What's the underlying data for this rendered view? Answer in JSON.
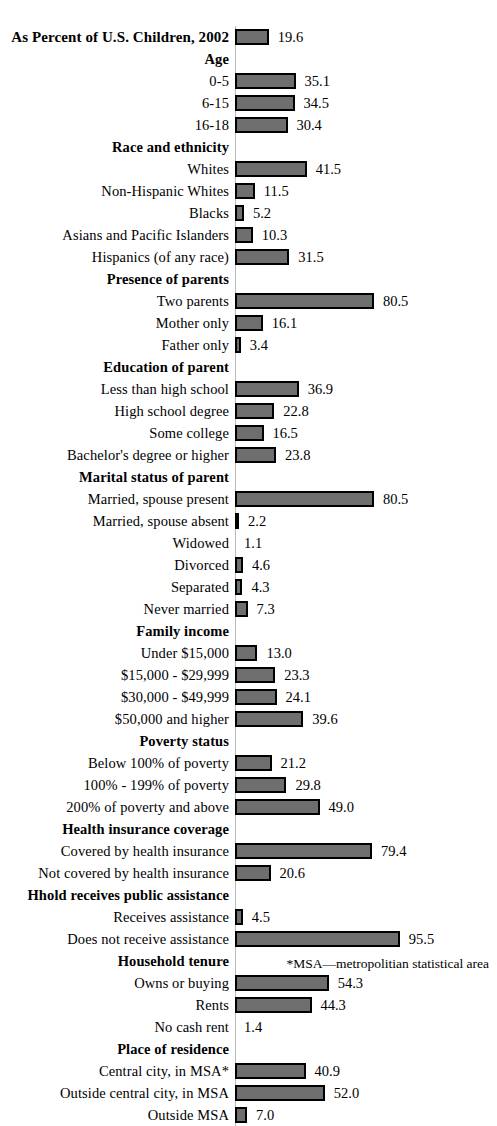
{
  "chart_data": {
    "type": "bar",
    "title": "As Percent of U.S. Children, 2002",
    "xlabel": "",
    "ylabel": "",
    "xlim": [
      0,
      95.5
    ],
    "grid": false,
    "legend": "none",
    "orientation": "horizontal",
    "value_format": "one-decimal percent",
    "footnote": "*MSA—metropolitian statistical area",
    "rows": [
      {
        "kind": "title",
        "label": "As Percent of U.S. Children, 2002",
        "value": 19.6,
        "value_text": "19.6"
      },
      {
        "kind": "header",
        "label": "Age"
      },
      {
        "kind": "data",
        "label": "0-5",
        "value": 35.1,
        "value_text": "35.1"
      },
      {
        "kind": "data",
        "label": "6-15",
        "value": 34.5,
        "value_text": "34.5"
      },
      {
        "kind": "data",
        "label": "16-18",
        "value": 30.4,
        "value_text": "30.4"
      },
      {
        "kind": "header",
        "label": "Race and ethnicity"
      },
      {
        "kind": "data",
        "label": "Whites",
        "value": 41.5,
        "value_text": "41.5"
      },
      {
        "kind": "data",
        "label": "Non-Hispanic Whites",
        "value": 11.5,
        "value_text": "11.5"
      },
      {
        "kind": "data",
        "label": "Blacks",
        "value": 5.2,
        "value_text": "5.2"
      },
      {
        "kind": "data",
        "label": "Asians and Pacific Islanders",
        "value": 10.3,
        "value_text": "10.3"
      },
      {
        "kind": "data",
        "label": "Hispanics (of any race)",
        "value": 31.5,
        "value_text": "31.5"
      },
      {
        "kind": "header",
        "label": "Presence of parents"
      },
      {
        "kind": "data",
        "label": "Two parents",
        "value": 80.5,
        "value_text": "80.5"
      },
      {
        "kind": "data",
        "label": "Mother only",
        "value": 16.1,
        "value_text": "16.1"
      },
      {
        "kind": "data",
        "label": "Father only",
        "value": 3.4,
        "value_text": "3.4"
      },
      {
        "kind": "header",
        "label": "Education of parent"
      },
      {
        "kind": "data",
        "label": "Less than high school",
        "value": 36.9,
        "value_text": "36.9"
      },
      {
        "kind": "data",
        "label": "High school degree",
        "value": 22.8,
        "value_text": "22.8"
      },
      {
        "kind": "data",
        "label": "Some college",
        "value": 16.5,
        "value_text": "16.5"
      },
      {
        "kind": "data",
        "label": "Bachelor's degree or higher",
        "value": 23.8,
        "value_text": "23.8"
      },
      {
        "kind": "header",
        "label": "Marital status of parent"
      },
      {
        "kind": "data",
        "label": "Married, spouse present",
        "value": 80.5,
        "value_text": "80.5"
      },
      {
        "kind": "data",
        "label": "Married, spouse absent",
        "value": 2.2,
        "value_text": "2.2"
      },
      {
        "kind": "data",
        "label": "Widowed",
        "value": 1.1,
        "value_text": "1.1",
        "no_bar": true
      },
      {
        "kind": "data",
        "label": "Divorced",
        "value": 4.6,
        "value_text": "4.6"
      },
      {
        "kind": "data",
        "label": "Separated",
        "value": 4.3,
        "value_text": "4.3"
      },
      {
        "kind": "data",
        "label": "Never married",
        "value": 7.3,
        "value_text": "7.3"
      },
      {
        "kind": "header",
        "label": "Family income"
      },
      {
        "kind": "data",
        "label": "Under $15,000",
        "value": 13.0,
        "value_text": "13.0"
      },
      {
        "kind": "data",
        "label": "$15,000 - $29,999",
        "value": 23.3,
        "value_text": "23.3"
      },
      {
        "kind": "data",
        "label": "$30,000 - $49,999",
        "value": 24.1,
        "value_text": "24.1"
      },
      {
        "kind": "data",
        "label": "$50,000 and higher",
        "value": 39.6,
        "value_text": "39.6"
      },
      {
        "kind": "header",
        "label": "Poverty status"
      },
      {
        "kind": "data",
        "label": "Below 100% of poverty",
        "value": 21.2,
        "value_text": "21.2"
      },
      {
        "kind": "data",
        "label": "100% - 199% of poverty",
        "value": 29.8,
        "value_text": "29.8"
      },
      {
        "kind": "data",
        "label": "200% of poverty and above",
        "value": 49.0,
        "value_text": "49.0"
      },
      {
        "kind": "header",
        "label": "Health insurance coverage"
      },
      {
        "kind": "data",
        "label": "Covered by health insurance",
        "value": 79.4,
        "value_text": "79.4"
      },
      {
        "kind": "data",
        "label": "Not covered by health insurance",
        "value": 20.6,
        "value_text": "20.6"
      },
      {
        "kind": "header",
        "label": "Hhold receives public assistance"
      },
      {
        "kind": "data",
        "label": "Receives assistance",
        "value": 4.5,
        "value_text": "4.5"
      },
      {
        "kind": "data",
        "label": "Does not receive assistance",
        "value": 95.5,
        "value_text": "95.5"
      },
      {
        "kind": "header",
        "label": "Household tenure"
      },
      {
        "kind": "data",
        "label": "Owns or buying",
        "value": 54.3,
        "value_text": "54.3"
      },
      {
        "kind": "data",
        "label": "Rents",
        "value": 44.3,
        "value_text": "44.3"
      },
      {
        "kind": "data",
        "label": "No cash rent",
        "value": 1.4,
        "value_text": "1.4",
        "no_bar": true
      },
      {
        "kind": "header",
        "label": "Place of residence"
      },
      {
        "kind": "data",
        "label": "Central city, in MSA*",
        "value": 40.9,
        "value_text": "40.9"
      },
      {
        "kind": "data",
        "label": "Outside central city, in MSA",
        "value": 52.0,
        "value_text": "52.0"
      },
      {
        "kind": "data",
        "label": "Outside MSA",
        "value": 7.0,
        "value_text": "7.0"
      }
    ]
  },
  "style": {
    "bar_fill": "#6e6e6e",
    "bar_border": "#000000",
    "axis_line": "#b9b9b9",
    "text": "#000000",
    "background": "#ffffff"
  }
}
